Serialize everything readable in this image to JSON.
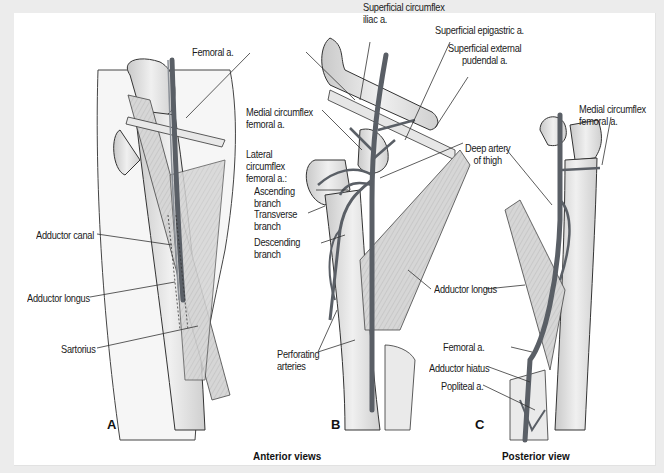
{
  "figure": {
    "panels": [
      {
        "letter": "A",
        "view": "anterior"
      },
      {
        "letter": "B",
        "view": "anterior"
      },
      {
        "letter": "C",
        "view": "posterior"
      }
    ],
    "captions": {
      "anterior": "Anterior views",
      "posterior": "Posterior view"
    },
    "labels": {
      "a_femoral": "Femoral a.",
      "a_adductor_canal": "Adductor canal",
      "a_adductor_longus": "Adductor longus",
      "a_sartorius": "Sartorius",
      "b_sup_circ_iliac_1": "Superficial circumflex",
      "b_sup_circ_iliac_2": "iliac a.",
      "b_sup_epigastric": "Superficial epigastric a.",
      "b_sup_ext_pudendal_1": "Superficial external",
      "b_sup_ext_pudendal_2": "pudendal a.",
      "b_med_circ_1": "Medial circumflex",
      "b_med_circ_2": "femoral a.",
      "b_lat_circ_1": "Lateral",
      "b_lat_circ_2": "circumflex",
      "b_lat_circ_3": "femoral a.:",
      "b_ascending_1": "Ascending",
      "b_ascending_2": "branch",
      "b_transverse_1": "Transverse",
      "b_transverse_2": "branch",
      "b_descending_1": "Descending",
      "b_descending_2": "branch",
      "b_deep_artery_1": "Deep artery",
      "b_deep_artery_2": "of thigh",
      "b_adductor_longus": "Adductor longus",
      "b_perforating_1": "Perforating",
      "b_perforating_2": "arteries",
      "c_med_circ_1": "Medial circumflex",
      "c_med_circ_2": "femoral a.",
      "c_femoral": "Femoral a.",
      "c_adductor_hiatus": "Adductor hiatus",
      "c_popliteal": "Popliteal a."
    },
    "colors": {
      "background": "#ececec",
      "panel": "#ffffff",
      "artery": "#5a5f66",
      "bone": "#e6e6e6",
      "muscle": "#cfcfcf",
      "outline": "#333333",
      "leader": "#333333"
    }
  }
}
